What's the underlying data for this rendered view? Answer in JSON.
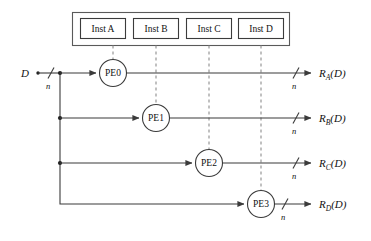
{
  "diagram": {
    "colors": {
      "wire": "#3b3b3b",
      "dashed": "#8d8d8d",
      "box_stroke": "#3b3b3b",
      "outer_box_stroke": "#5a5a5a",
      "background": "#ffffff",
      "text": "#111111"
    },
    "instruction_bar": {
      "name": "instruction-container",
      "boxes": [
        {
          "label": "Inst A",
          "target": "PE0"
        },
        {
          "label": "Inst B",
          "target": "PE1"
        },
        {
          "label": "Inst C",
          "target": "PE2"
        },
        {
          "label": "Inst D",
          "target": "PE3"
        }
      ]
    },
    "input": {
      "label": "D",
      "bus_width_label": "n"
    },
    "rows": [
      {
        "pe_label": "PE0",
        "output_base": "R",
        "output_sub": "A",
        "output_arg": "(D)",
        "output_full": "R_A(D)",
        "bus_width_label": "n"
      },
      {
        "pe_label": "PE1",
        "output_base": "R",
        "output_sub": "B",
        "output_arg": "(D)",
        "output_full": "R_B(D)",
        "bus_width_label": "n"
      },
      {
        "pe_label": "PE2",
        "output_base": "R",
        "output_sub": "C",
        "output_arg": "(D)",
        "output_full": "R_C(D)",
        "bus_width_label": "n"
      },
      {
        "pe_label": "PE3",
        "output_base": "R",
        "output_sub": "D",
        "output_arg": "(D)",
        "output_full": "R_D(D)",
        "bus_width_label": "n"
      }
    ]
  }
}
